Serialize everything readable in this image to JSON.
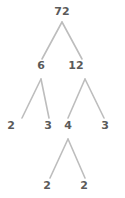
{
  "diagram": {
    "type": "factor-tree",
    "background_color": "#ffffff",
    "edge_color": "#bdbdbd",
    "text_color": "#5a5a5a",
    "root_value": "72",
    "nodes": [
      {
        "id": "n72",
        "label": "72",
        "x": 62,
        "y": 12,
        "level": 0
      },
      {
        "id": "n6",
        "label": "6",
        "x": 41,
        "y": 66,
        "level": 1
      },
      {
        "id": "n12",
        "label": "12",
        "x": 76,
        "y": 66,
        "level": 1
      },
      {
        "id": "n2a",
        "label": "2",
        "x": 11,
        "y": 126,
        "level": 2
      },
      {
        "id": "n3a",
        "label": "3",
        "x": 48,
        "y": 126,
        "level": 2
      },
      {
        "id": "n4",
        "label": "4",
        "x": 68,
        "y": 126,
        "level": 2
      },
      {
        "id": "n3b",
        "label": "3",
        "x": 105,
        "y": 126,
        "level": 2
      },
      {
        "id": "n2b",
        "label": "2",
        "x": 47,
        "y": 186,
        "level": 3
      },
      {
        "id": "n2c",
        "label": "2",
        "x": 84,
        "y": 186,
        "level": 3
      }
    ],
    "edges": [
      {
        "from": "n72",
        "to": "n6",
        "x1": 62,
        "y1": 22,
        "x2": 42,
        "y2": 59
      },
      {
        "from": "n72",
        "to": "n12",
        "x1": 62,
        "y1": 22,
        "x2": 82,
        "y2": 59
      },
      {
        "from": "n6",
        "to": "n2a",
        "x1": 41,
        "y1": 79,
        "x2": 22,
        "y2": 118
      },
      {
        "from": "n6",
        "to": "n3a",
        "x1": 41,
        "y1": 79,
        "x2": 49,
        "y2": 118
      },
      {
        "from": "n12",
        "to": "n4",
        "x1": 85,
        "y1": 79,
        "x2": 68,
        "y2": 118
      },
      {
        "from": "n12",
        "to": "n3b",
        "x1": 85,
        "y1": 79,
        "x2": 104,
        "y2": 118
      },
      {
        "from": "n4",
        "to": "n2b",
        "x1": 68,
        "y1": 139,
        "x2": 50,
        "y2": 178
      },
      {
        "from": "n4",
        "to": "n2c",
        "x1": 68,
        "y1": 139,
        "x2": 85,
        "y2": 178
      }
    ]
  }
}
